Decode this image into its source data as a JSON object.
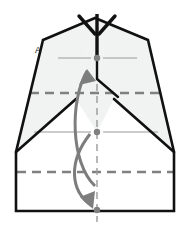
{
  "figure": {
    "kind": "origami-fold-diagram",
    "caption_labels": [
      {
        "name": "point-label-a",
        "text": "A",
        "x": 38,
        "y": 53
      }
    ],
    "colors": {
      "outline": "#111111",
      "paper_fill": "#ffffff",
      "shaded_fill": "#f1f2f2",
      "crease_dashed": "#808080",
      "crease_thin": "#9a9a9a",
      "axis_dashdot": "#9a9a9a",
      "arrow": "#7d7d7d",
      "dot": "#808080",
      "label": "#1a1a1a"
    },
    "outline_points": "95,18 43,40 16,152 16,211 95,211 174,211 174,152 148,40",
    "silhouette": {
      "apex_x": 95,
      "apex_y": 18,
      "left_shoulder_x": 16,
      "right_shoulder_x": 174,
      "shoulder_y": 152,
      "base_y": 211
    },
    "dots": [
      {
        "name": "fold-dot-top",
        "cx": 97,
        "cy": 58,
        "r": 3.2
      },
      {
        "name": "fold-dot-middle",
        "cx": 97,
        "cy": 132,
        "r": 3.2
      },
      {
        "name": "fold-dot-bottom",
        "cx": 97,
        "cy": 210,
        "r": 3.2
      }
    ],
    "dashed_creases": [
      {
        "name": "crease-upper-dashed",
        "x1": 30,
        "y1": 93,
        "x2": 163,
        "y2": 93
      },
      {
        "name": "crease-lower-dashed",
        "x1": 17,
        "y1": 172,
        "x2": 173,
        "y2": 172
      }
    ],
    "thin_creases": [
      {
        "name": "crease-top-left-thin",
        "x1": 58,
        "y1": 58,
        "x2": 91,
        "y2": 58
      },
      {
        "name": "crease-top-right-thin",
        "x1": 103,
        "y1": 58,
        "x2": 137,
        "y2": 58
      },
      {
        "name": "crease-middle-left-thin",
        "x1": 34,
        "y1": 132,
        "x2": 91,
        "y2": 132
      },
      {
        "name": "crease-middle-right-thin",
        "x1": 103,
        "y1": 132,
        "x2": 158,
        "y2": 132
      }
    ],
    "diagonal_creases": [
      {
        "name": "diagonal-left-crease",
        "x1": 16,
        "y1": 152,
        "x2": 76,
        "y2": 99
      },
      {
        "name": "diagonal-right-crease",
        "x1": 174,
        "y1": 152,
        "x2": 114,
        "y2": 99
      },
      {
        "name": "center-stem-left",
        "x1": 97,
        "y1": 60,
        "x2": 97,
        "y2": 78
      },
      {
        "name": "center-stem-kick",
        "x1": 97,
        "y1": 78,
        "x2": 118,
        "y2": 96
      }
    ],
    "center_axis": {
      "name": "center-axis-dashdot",
      "x": 97,
      "y_top": 24,
      "y_bottom": 222
    },
    "top_arrow": {
      "name": "trident-arrowhead-down",
      "shaft": {
        "x1": 97,
        "y1": 14,
        "x2": 97,
        "y2": 56
      },
      "barbs": [
        {
          "x1": 80,
          "y1": 17,
          "x2": 95,
          "y2": 33
        },
        {
          "x1": 114,
          "y1": 17,
          "x2": 99,
          "y2": 33
        }
      ]
    },
    "curved_arrows": [
      {
        "name": "fold-arrow-up",
        "direction": "up",
        "path": "M 94,184 C 72,160 72,100 87,70",
        "head": "M 87,70 L 80,84 L 96,82 Z"
      },
      {
        "name": "fold-arrow-down",
        "direction": "down",
        "path": "M 90,133 C 70,160 72,190 92,207",
        "head": "M 92,207 L 95,192 L 80,198 Z"
      }
    ]
  }
}
